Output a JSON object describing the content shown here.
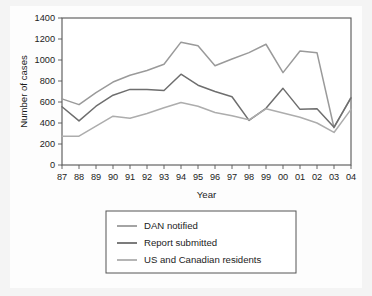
{
  "chart_data": {
    "type": "line",
    "title": "",
    "xlabel": "Year",
    "ylabel": "Number of cases",
    "grid": false,
    "legend_position": "bottom",
    "ylim": [
      0,
      1400
    ],
    "yticks": [
      0,
      200,
      400,
      600,
      800,
      1000,
      1200,
      1400
    ],
    "ytick_labels": [
      "0",
      "200",
      "400",
      "600",
      "800",
      "1000",
      "1200",
      "1400"
    ],
    "categories": [
      "87",
      "88",
      "89",
      "90",
      "91",
      "92",
      "93",
      "94",
      "95",
      "96",
      "97",
      "98",
      "99",
      "00",
      "01",
      "02",
      "03",
      "04"
    ],
    "series": [
      {
        "name": "DAN notified",
        "color": "#9a9a9a",
        "values": [
          630,
          575,
          690,
          790,
          855,
          900,
          960,
          1170,
          1135,
          945,
          1010,
          1070,
          1150,
          880,
          1085,
          1070,
          355,
          645
        ]
      },
      {
        "name": "Report submitted",
        "color": "#6e6e6e",
        "values": [
          555,
          420,
          560,
          665,
          720,
          720,
          710,
          865,
          760,
          700,
          650,
          425,
          540,
          730,
          530,
          535,
          360,
          640
        ]
      },
      {
        "name": "US and Canadian residents",
        "color": "#adadad",
        "values": [
          275,
          275,
          370,
          465,
          445,
          490,
          545,
          595,
          560,
          500,
          470,
          430,
          535,
          495,
          455,
          400,
          310,
          530
        ]
      }
    ]
  },
  "legend": {
    "items": [
      {
        "label": "DAN notified"
      },
      {
        "label": "Report submitted"
      },
      {
        "label": "US and Canadian residents"
      }
    ]
  },
  "axes": {
    "x_title": "Year",
    "y_title": "Number of cases"
  },
  "colors": {
    "figure_background": "#f4f4f4",
    "plot_background": "#ffffff",
    "axis": "#555555",
    "text": "#1c1c1c"
  }
}
